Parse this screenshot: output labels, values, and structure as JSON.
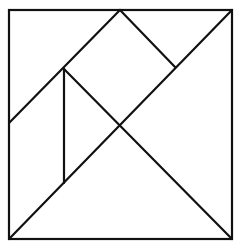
{
  "diagram": {
    "type": "tangram",
    "stroke_color": "#111111",
    "background": "#ffffff",
    "stroke_width": 2.2,
    "outer_square": {
      "x1": 9,
      "y1": 10,
      "x2": 232,
      "y2": 239
    },
    "lines": [
      {
        "name": "main-diagonal",
        "x1": 9,
        "y1": 239,
        "x2": 232,
        "y2": 10
      },
      {
        "name": "center-to-bottom-right",
        "x1": 64,
        "y1": 69,
        "x2": 232,
        "y2": 239
      },
      {
        "name": "top-mid-to-left-edge",
        "x1": 120,
        "y1": 10,
        "x2": 9,
        "y2": 123
      },
      {
        "name": "top-mid-to-diagonal",
        "x1": 120,
        "y1": 10,
        "x2": 175,
        "y2": 67
      },
      {
        "name": "vertical-parallelogram-edge",
        "x1": 64,
        "y1": 69,
        "x2": 64,
        "y2": 183
      }
    ]
  }
}
